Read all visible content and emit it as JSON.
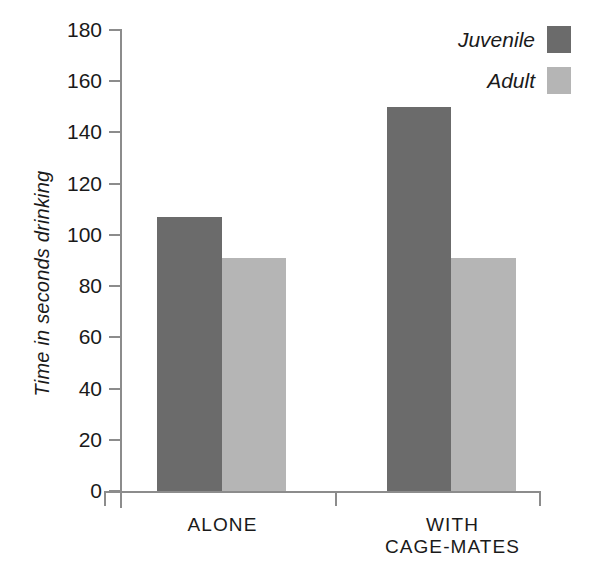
{
  "chart_data": {
    "type": "bar",
    "title": "",
    "xlabel": "",
    "ylabel": "Time in seconds drinking",
    "categories": [
      "ALONE",
      "WITH CAGE-MATES"
    ],
    "category_lines": [
      [
        "ALONE"
      ],
      [
        "WITH",
        "CAGE-MATES"
      ]
    ],
    "series": [
      {
        "name": "Juvenile",
        "values": [
          107,
          150
        ],
        "color": "#6b6b6b"
      },
      {
        "name": "Adult",
        "values": [
          91,
          91
        ],
        "color": "#b5b5b5"
      }
    ],
    "ylim": [
      0,
      180
    ],
    "yticks": [
      0,
      20,
      40,
      60,
      80,
      100,
      120,
      140,
      160,
      180
    ],
    "ytick_labels": [
      "0",
      "20",
      "40",
      "60",
      "80",
      "100",
      "120",
      "140",
      "160",
      "180"
    ],
    "grid": false,
    "legend_position": "top-right"
  },
  "legend": {
    "items": [
      {
        "label": "Juvenile",
        "color": "#6b6b6b"
      },
      {
        "label": "Adult",
        "color": "#b5b5b5"
      }
    ]
  },
  "axis": {
    "line_color": "#8c8c8c"
  }
}
